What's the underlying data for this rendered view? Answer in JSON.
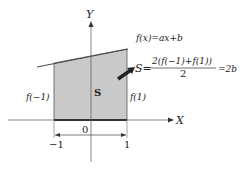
{
  "diagram": {
    "axes": {
      "x_label": "X",
      "y_label": "Y",
      "origin_label": "0"
    },
    "ticks": {
      "left": "−1",
      "right": "1"
    },
    "function_label": "f(x)=ax+b",
    "region_label": "S",
    "left_height_label": "f(−1)",
    "right_height_label": "f(1)",
    "formula": {
      "lhs": "S=",
      "numerator": "2(f(−1)+f(1))",
      "denominator": "2",
      "rhs": "=2b"
    },
    "colors": {
      "fill": "#c8c8c8",
      "line": "#333333",
      "axis": "#555555"
    }
  }
}
